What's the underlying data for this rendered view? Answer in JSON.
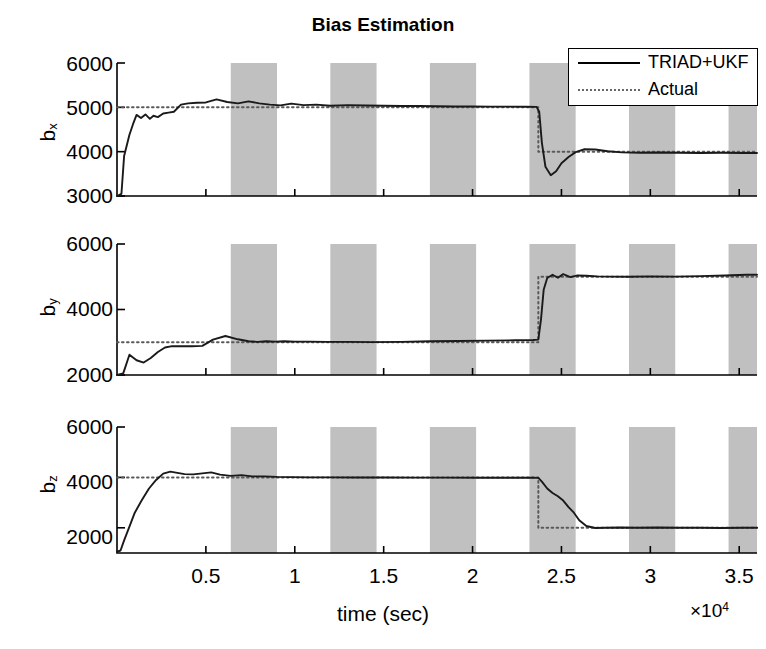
{
  "figure": {
    "title": "Bias Estimation",
    "background_color": "#ffffff",
    "band_color": "#c0c0c0",
    "line_color": "#1a1a1a",
    "actual_color": "#5a5a5a"
  },
  "legend": {
    "position": "top-right",
    "entries": [
      {
        "label": "TRIAD+UKF",
        "style": "solid"
      },
      {
        "label": "Actual",
        "style": "dotted"
      }
    ]
  },
  "xaxis": {
    "label": "time (sec)",
    "exponent_prefix": "×10",
    "exponent_power": "4",
    "exponent_text": "×10⁴",
    "ticks": [
      0.5,
      1,
      1.5,
      2,
      2.5,
      3,
      3.5
    ],
    "tick_labels": [
      "0.5",
      "1",
      "1.5",
      "2",
      "2.5",
      "3",
      "3.5"
    ],
    "range": [
      0,
      36000
    ]
  },
  "subplots": [
    {
      "ylabel_main": "b",
      "ylabel_sub": "x",
      "ylabel_text": "b_x",
      "ytick_labels": [
        "6000",
        "5000",
        "4000",
        "3000"
      ],
      "yticks": [
        6000,
        5000,
        4000,
        3000
      ],
      "ylim": [
        3000,
        6000
      ]
    },
    {
      "ylabel_main": "b",
      "ylabel_sub": "y",
      "ylabel_text": "b_y",
      "ytick_labels": [
        "6000",
        "4000",
        "2000"
      ],
      "yticks": [
        6000,
        4000,
        2000
      ],
      "ylim": [
        2000,
        6000
      ]
    },
    {
      "ylabel_main": "b",
      "ylabel_sub": "z",
      "ylabel_text": "b_z",
      "ytick_labels": [
        "6000",
        "4000",
        "2000"
      ],
      "yticks": [
        6000,
        4000,
        2000
      ],
      "ylim": [
        1000,
        6000
      ]
    }
  ],
  "chart_data": {
    "type": "line",
    "title": "Bias Estimation",
    "xlabel": "time (sec)",
    "x_exponent": "×10⁴",
    "xlim": [
      0,
      36000
    ],
    "xticks": [
      5000,
      10000,
      15000,
      20000,
      25000,
      30000,
      35000
    ],
    "xtick_labels": [
      "0.5",
      "1",
      "1.5",
      "2",
      "2.5",
      "3",
      "3.5"
    ],
    "grid": false,
    "legend": [
      "TRIAD+UKF",
      "Actual"
    ],
    "legend_position": "upper right",
    "shaded_bands": [
      [
        6400,
        9000
      ],
      [
        12000,
        14600
      ],
      [
        17600,
        20200
      ],
      [
        23200,
        25800
      ],
      [
        28800,
        31400
      ],
      [
        34400,
        37000
      ]
    ],
    "panels": [
      {
        "ylabel": "b_x",
        "ylim": [
          3000,
          6000
        ],
        "yticks": [
          3000,
          4000,
          5000,
          6000
        ],
        "series": [
          {
            "name": "Actual",
            "style": "dotted",
            "x": [
              0,
              23700,
              23700,
              36000
            ],
            "y": [
              5000,
              5000,
              4000,
              4000
            ]
          },
          {
            "name": "TRIAD+UKF",
            "style": "solid",
            "x": [
              0,
              250,
              400,
              700,
              900,
              1100,
              1350,
              1600,
              1850,
              2050,
              2300,
              2600,
              2900,
              3200,
              3600,
              4000,
              4500,
              5000,
              5600,
              6200,
              6800,
              7400,
              8000,
              8600,
              9200,
              9800,
              10500,
              11200,
              12000,
              13000,
              14000,
              15000,
              16000,
              17000,
              18000,
              19000,
              20000,
              21000,
              22000,
              23000,
              23600,
              23750,
              23900,
              24100,
              24400,
              24700,
              25000,
              25400,
              25800,
              26300,
              26900,
              27600,
              28400,
              29400,
              30500,
              31600,
              32800,
              34000,
              35200,
              36000
            ],
            "y": [
              3000,
              3050,
              3900,
              4380,
              4620,
              4830,
              4760,
              4840,
              4740,
              4810,
              4780,
              4860,
              4880,
              4900,
              5060,
              5090,
              5105,
              5110,
              5180,
              5120,
              5090,
              5135,
              5090,
              5060,
              5045,
              5085,
              5050,
              5060,
              5035,
              5050,
              5040,
              5035,
              5030,
              5030,
              5025,
              5020,
              5020,
              5015,
              5015,
              5012,
              5010,
              4900,
              4200,
              3660,
              3470,
              3560,
              3740,
              3880,
              3990,
              4055,
              4050,
              4010,
              3985,
              3975,
              3980,
              3975,
              3970,
              3975,
              3970,
              3970
            ]
          }
        ]
      },
      {
        "ylabel": "b_y",
        "ylim": [
          2000,
          6000
        ],
        "yticks": [
          2000,
          4000,
          6000
        ],
        "series": [
          {
            "name": "Actual",
            "style": "dotted",
            "x": [
              0,
              23700,
              23700,
              36000
            ],
            "y": [
              3000,
              3000,
              5000,
              5000
            ]
          },
          {
            "name": "TRIAD+UKF",
            "style": "solid",
            "x": [
              0,
              350,
              700,
              1100,
              1500,
              1900,
              2300,
              2700,
              3100,
              3600,
              4200,
              4800,
              5400,
              6100,
              6800,
              7400,
              7900,
              8400,
              8900,
              9400,
              10000,
              10800,
              11800,
              13000,
              14400,
              16000,
              17600,
              19200,
              20800,
              22400,
              23400,
              23700,
              23850,
              24000,
              24200,
              24500,
              24800,
              25100,
              25500,
              25900,
              26400,
              27000,
              27800,
              28800,
              30000,
              31400,
              32800,
              34200,
              35400,
              36000
            ],
            "y": [
              2000,
              2050,
              2620,
              2450,
              2380,
              2520,
              2700,
              2840,
              2880,
              2880,
              2880,
              2890,
              3080,
              3190,
              3090,
              3030,
              3010,
              3030,
              3020,
              3030,
              3020,
              3020,
              3010,
              3010,
              3005,
              3010,
              3030,
              3040,
              3050,
              3060,
              3070,
              3080,
              3700,
              4600,
              4960,
              5060,
              4970,
              5080,
              4990,
              5040,
              5030,
              5010,
              5005,
              5000,
              5010,
              5005,
              5020,
              5040,
              5060,
              5060
            ]
          }
        ]
      },
      {
        "ylabel": "b_z",
        "ylim": [
          1000,
          6000
        ],
        "yticks": [
          2000,
          4000,
          6000
        ],
        "series": [
          {
            "name": "Actual",
            "style": "dotted",
            "x": [
              0,
              23700,
              23700,
              36000
            ],
            "y": [
              4000,
              4000,
              2000,
              2000
            ]
          },
          {
            "name": "TRIAD+UKF",
            "style": "solid",
            "x": [
              0,
              200,
              400,
              700,
              1000,
              1400,
              1800,
              2200,
              2600,
              3000,
              3400,
              3800,
              4300,
              4800,
              5300,
              5800,
              6400,
              7000,
              7600,
              8300,
              9000,
              9800,
              10800,
              12000,
              13400,
              15000,
              16800,
              18600,
              20400,
              22200,
              23400,
              23700,
              23900,
              24200,
              24500,
              24800,
              25100,
              25400,
              25700,
              26000,
              26400,
              26900,
              27500,
              28300,
              29200,
              30400,
              31600,
              32800,
              34000,
              35200,
              36000
            ],
            "y": [
              1050,
              1100,
              1500,
              2050,
              2600,
              3100,
              3560,
              3900,
              4150,
              4230,
              4180,
              4130,
              4120,
              4160,
              4200,
              4110,
              4060,
              4090,
              4040,
              4040,
              4020,
              4010,
              4000,
              4000,
              3995,
              3995,
              3990,
              3990,
              3985,
              3985,
              3985,
              3980,
              3830,
              3560,
              3380,
              3250,
              3080,
              2820,
              2600,
              2300,
              2070,
              1990,
              2000,
              2010,
              2000,
              2010,
              2000,
              2000,
              1995,
              2000,
              2000
            ]
          }
        ]
      }
    ]
  }
}
